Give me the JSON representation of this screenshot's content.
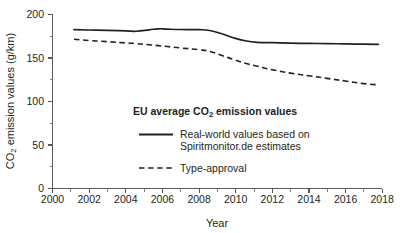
{
  "chart_data": {
    "type": "line",
    "title": "",
    "xlabel": "Year",
    "ylabel_parts": {
      "pre": "CO",
      "sub": "2",
      "post": " emission values (g/km)"
    },
    "ylabel": "CO2 emission values (g/km)",
    "xlim": [
      2000,
      2018
    ],
    "ylim": [
      0,
      200
    ],
    "grid": false,
    "x_ticks": [
      "2000",
      "2002",
      "2004",
      "2006",
      "2008",
      "2010",
      "2012",
      "2014",
      "2016",
      "2018"
    ],
    "x_tick_values": [
      2000,
      2002,
      2004,
      2006,
      2008,
      2010,
      2012,
      2014,
      2016,
      2018
    ],
    "y_ticks": [
      "0",
      "50",
      "100",
      "150",
      "200"
    ],
    "y_tick_values": [
      0,
      50,
      100,
      150,
      200
    ],
    "y_minor_values": [
      25,
      75,
      125,
      175
    ],
    "x_minor_values": [
      2001,
      2003,
      2005,
      2007,
      2009,
      2011,
      2013,
      2015,
      2017
    ],
    "legend_position": "center",
    "legend_title_parts": {
      "pre": "EU average CO",
      "sub": "2",
      "post": " emission values"
    },
    "legend_title": "EU average CO2 emission values",
    "x": [
      2001.2,
      2002,
      2003,
      2004,
      2004.6,
      2005.3,
      2005.8,
      2006.3,
      2007,
      2008,
      2008.6,
      2009.3,
      2010,
      2010.6,
      2011.2,
      2012,
      2013,
      2014,
      2015,
      2016,
      2017,
      2017.8
    ],
    "series": [
      {
        "name": "Real-world values based on Spiritmonitor.de estimates",
        "style": "solid",
        "label_line1": "Real-world values based on",
        "label_line2": "Spiritmonitor.de estimates",
        "values": [
          182,
          181.6,
          181.2,
          180.6,
          180.2,
          181.8,
          183,
          182.6,
          182.2,
          182,
          181,
          177,
          172,
          169,
          167.5,
          167,
          166.5,
          166.2,
          166,
          165.6,
          165.3,
          165
        ]
      },
      {
        "name": "Type-approval",
        "style": "dashed",
        "label_line1": "Type-approval",
        "label_line2": "",
        "values": [
          171,
          169.6,
          168.2,
          166.8,
          166,
          164.6,
          163.6,
          162.6,
          161,
          159,
          157,
          152,
          147,
          143,
          140,
          136,
          132,
          129,
          126,
          123,
          120,
          118.5
        ]
      }
    ],
    "colors": {
      "series_line": "#231f20",
      "axis": "#58595b",
      "text": "#231f20",
      "background": "#ffffff"
    }
  },
  "layout": {
    "plot_left": 52,
    "plot_right": 382,
    "plot_top": 14,
    "plot_bottom": 188
  }
}
